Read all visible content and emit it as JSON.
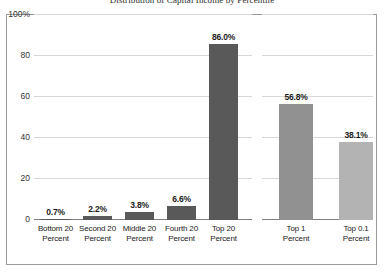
{
  "chart_data": {
    "type": "bar",
    "title": "Distribution of Capital Income by Percentile",
    "xlabel": "",
    "ylabel": "",
    "ylim": [
      0,
      100
    ],
    "yticks": [
      "100%",
      "80",
      "60",
      "40",
      "20",
      "0"
    ],
    "ytick_values": [
      100,
      80,
      60,
      40,
      20,
      0
    ],
    "grid": true,
    "legend": "none",
    "panels": [
      {
        "name": "quintiles",
        "categories": [
          "Bottom 20 Percent",
          "Second 20 Percent",
          "Middle 20 Percent",
          "Fourth 20 Percent",
          "Top 20 Percent"
        ],
        "values": [
          0.7,
          2.2,
          3.8,
          6.6,
          86.0
        ],
        "labels": [
          "0.7%",
          "2.2%",
          "3.8%",
          "6.6%",
          "86.0%"
        ],
        "colors": [
          "#595959",
          "#595959",
          "#595959",
          "#595959",
          "#595959"
        ]
      },
      {
        "name": "top-shares",
        "categories": [
          "Top 1 Percent",
          "Top 0.1 Percent"
        ],
        "values": [
          56.8,
          38.1
        ],
        "labels": [
          "56.8%",
          "38.1%"
        ],
        "colors": [
          "#919191",
          "#b3b3b3"
        ]
      }
    ]
  },
  "chart": {
    "title": "Distribution of Capital Income by Percentile",
    "axis": {
      "y_labels": [
        "100%",
        "80",
        "60",
        "40",
        "20",
        "0"
      ]
    },
    "left_panel": {
      "bars": [
        {
          "label": "0.7%",
          "line1": "Bottom 20",
          "line2": "Percent"
        },
        {
          "label": "2.2%",
          "line1": "Second 20",
          "line2": "Percent"
        },
        {
          "label": "3.8%",
          "line1": "Middle 20",
          "line2": "Percent"
        },
        {
          "label": "6.6%",
          "line1": "Fourth 20",
          "line2": "Percent"
        },
        {
          "label": "86.0%",
          "line1": "Top 20",
          "line2": "Percent"
        }
      ]
    },
    "right_panel": {
      "bars": [
        {
          "label": "56.8%",
          "line1": "Top 1",
          "line2": "Percent"
        },
        {
          "label": "38.1%",
          "line1": "Top 0.1",
          "line2": "Percent"
        }
      ]
    },
    "colors": {
      "bar_dark": "#595959",
      "bar_mid": "#919191",
      "bar_light": "#b3b3b3",
      "gridline": "#d7d7d7",
      "frame": "#9a9a9a",
      "text": "#1b1b1b"
    }
  }
}
